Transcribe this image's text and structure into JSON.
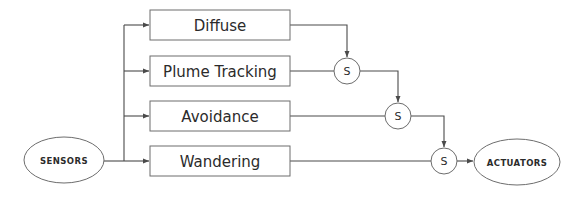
{
  "diagram": {
    "type": "block-diagram",
    "colors": {
      "background": "#ffffff",
      "shape_stroke": "#6d6d6d",
      "connector_stroke": "#4a4a4a",
      "text": "#2b2b2b"
    },
    "input": {
      "label": "SENSORS",
      "shape": "ellipse",
      "cx": 64,
      "cy": 160,
      "rx": 40,
      "ry": 23
    },
    "output": {
      "label": "ACTUATORS",
      "shape": "ellipse",
      "cx": 517,
      "cy": 162,
      "rx": 43,
      "ry": 23
    },
    "behaviors": [
      {
        "label": "Diffuse",
        "x": 150,
        "y": 10,
        "w": 140,
        "h": 30,
        "row_y": 25
      },
      {
        "label": "Plume Tracking",
        "x": 150,
        "y": 56,
        "w": 140,
        "h": 30,
        "row_y": 71
      },
      {
        "label": "Avoidance",
        "x": 150,
        "y": 101,
        "w": 140,
        "h": 30,
        "row_y": 116
      },
      {
        "label": "Wandering",
        "x": 150,
        "y": 146,
        "w": 140,
        "h": 30,
        "row_y": 161
      }
    ],
    "suppressor_nodes": [
      {
        "label": "S",
        "cx": 347,
        "cy": 71,
        "r": 13
      },
      {
        "label": "S",
        "cx": 398,
        "cy": 116,
        "r": 13
      },
      {
        "label": "S",
        "cx": 444,
        "cy": 161,
        "r": 13
      }
    ],
    "bus": {
      "x": 124,
      "top_y": 25,
      "bottom_y": 161
    },
    "connections": [
      {
        "from": "sensors",
        "to": "bus",
        "kind": "line"
      },
      {
        "from": "bus",
        "to": "diffuse",
        "kind": "arrow"
      },
      {
        "from": "bus",
        "to": "plume-tracking",
        "kind": "arrow"
      },
      {
        "from": "bus",
        "to": "avoidance",
        "kind": "arrow"
      },
      {
        "from": "bus",
        "to": "wandering",
        "kind": "arrow"
      },
      {
        "from": "diffuse",
        "to": "suppressor-1",
        "kind": "arrow"
      },
      {
        "from": "plume-tracking",
        "to": "suppressor-1",
        "kind": "line"
      },
      {
        "from": "suppressor-1",
        "to": "suppressor-2",
        "kind": "arrow"
      },
      {
        "from": "avoidance",
        "to": "suppressor-2",
        "kind": "line"
      },
      {
        "from": "suppressor-2",
        "to": "suppressor-3",
        "kind": "arrow"
      },
      {
        "from": "wandering",
        "to": "suppressor-3",
        "kind": "line"
      },
      {
        "from": "suppressor-3",
        "to": "actuators",
        "kind": "arrow"
      }
    ]
  }
}
